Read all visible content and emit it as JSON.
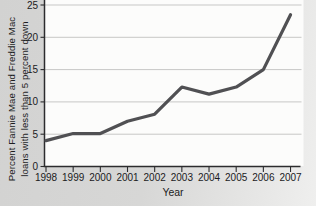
{
  "figure": {
    "ylabel_line1": "Percent Fannie Mae and Freddie Mac",
    "ylabel_line2": "loans with less than 5 percent down"
  },
  "chart_data": {
    "type": "line",
    "title": "",
    "x": [
      1998,
      1999,
      2000,
      2001,
      2002,
      2003,
      2004,
      2005,
      2006,
      2007
    ],
    "series": [
      {
        "name": "Percent Fannie Mae and Freddie Mac loans with less than 5 percent down",
        "values": [
          4.0,
          5.1,
          5.1,
          7.0,
          8.1,
          12.3,
          11.2,
          12.3,
          15.0,
          23.5
        ]
      }
    ],
    "xlabel": "Year",
    "ylabel": "Percent Fannie Mae and Freddie Mac loans with less than 5 percent down",
    "ylim": [
      0,
      25
    ],
    "yticks": [
      0,
      5,
      10,
      15,
      20,
      25
    ],
    "grid": true,
    "legend": false,
    "line_color": "#505053",
    "axis_color": "#2c2c2e",
    "gridline_color": "#c7c7c6",
    "plot_bg": "#fcfcfb",
    "tick_label_color": "#1b1b1d"
  }
}
